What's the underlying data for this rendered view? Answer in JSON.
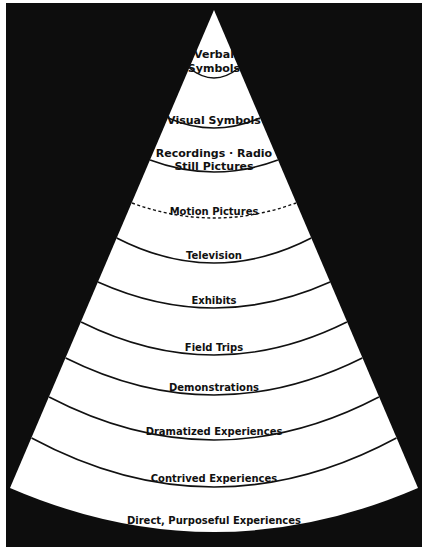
{
  "diagram": {
    "type": "cone-of-experience",
    "colors": {
      "background": "#0d0d0d",
      "cone": "#ffffff",
      "ink": "#111111"
    },
    "levels": [
      {
        "id": "verbal-symbols",
        "lines": [
          "Verbal",
          "Symbols"
        ],
        "divider": "solid"
      },
      {
        "id": "visual-symbols",
        "lines": [
          "Visual Symbols"
        ],
        "divider": "solid"
      },
      {
        "id": "recordings-radio-still-pictures",
        "lines": [
          "Recordings · Radio",
          "Still Pictures"
        ],
        "divider": "solid"
      },
      {
        "id": "motion-pictures",
        "lines": [
          "Motion Pictures"
        ],
        "divider": "dashed"
      },
      {
        "id": "television",
        "lines": [
          "Television"
        ],
        "divider": "solid"
      },
      {
        "id": "exhibits",
        "lines": [
          "Exhibits"
        ],
        "divider": "solid"
      },
      {
        "id": "field-trips",
        "lines": [
          "Field Trips"
        ],
        "divider": "solid"
      },
      {
        "id": "demonstrations",
        "lines": [
          "Demonstrations"
        ],
        "divider": "solid"
      },
      {
        "id": "dramatized-experiences",
        "lines": [
          "Dramatized Experiences"
        ],
        "divider": "solid"
      },
      {
        "id": "contrived-experiences",
        "lines": [
          "Contrived Experiences"
        ],
        "divider": "solid"
      },
      {
        "id": "direct-purposeful-experiences",
        "lines": [
          "Direct, Purposeful Experiences"
        ],
        "divider": "none"
      }
    ]
  }
}
